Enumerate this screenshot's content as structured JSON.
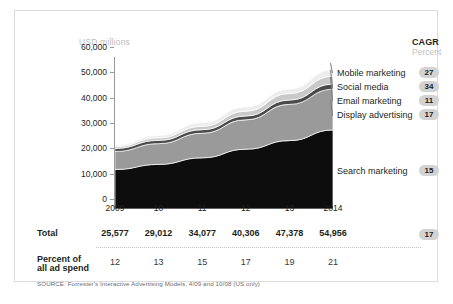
{
  "chart_data": {
    "type": "area",
    "title": "",
    "ylabel": "USD millions",
    "xlabel": "",
    "categories": [
      "2009",
      "10",
      "11",
      "12",
      "13",
      "2014"
    ],
    "x": [
      2009,
      2010,
      2011,
      2012,
      2013,
      2014
    ],
    "ylim": [
      0,
      60000
    ],
    "yticks": [
      "0",
      "10,000",
      "20,000",
      "30,000",
      "40,000",
      "50,000",
      "60,000"
    ],
    "ytick_values": [
      0,
      10000,
      20000,
      30000,
      40000,
      50000,
      60000
    ],
    "grid": false,
    "stacked": true,
    "legend_position": "right",
    "series": [
      {
        "name": "Search marketing",
        "color": "#0d0d0d",
        "cagr": "15",
        "values": [
          15600,
          17600,
          20200,
          23600,
          27000,
          31200
        ]
      },
      {
        "name": "Display advertising",
        "color": "#9a9a9a",
        "cagr": "17",
        "values": [
          7100,
          8200,
          9700,
          11600,
          14300,
          16100
        ]
      },
      {
        "name": "Email marketing",
        "color": "#4a4a4a",
        "cagr": "11",
        "values": [
          1200,
          1300,
          1400,
          1500,
          1700,
          2000
        ]
      },
      {
        "name": "Social media",
        "color": "#c9c9c9",
        "cagr": "34",
        "values": [
          716,
          980,
          1350,
          1900,
          2600,
          3100
        ]
      },
      {
        "name": "Mobile marketing",
        "color": "#ededed",
        "cagr": "27",
        "values": [
          561,
          932,
          1427,
          1706,
          1778,
          2556
        ]
      }
    ],
    "totals": [
      "25,577",
      "29,012",
      "34,077",
      "40,306",
      "47,378",
      "54,956"
    ],
    "total_values": [
      25577,
      29012,
      34077,
      40306,
      47378,
      54956
    ],
    "percent_of_ad_spend": [
      "12",
      "13",
      "15",
      "17",
      "19",
      "21"
    ],
    "total_cagr": "17"
  },
  "header": {
    "cagr_title": "CAGR",
    "cagr_subtitle": "Percent"
  },
  "table": {
    "total_label": "Total",
    "percent_label_line1": "Percent of",
    "percent_label_line2": "all ad spend"
  },
  "source": "SOURCE: Forrester's Interactive Advertising Models, 4/09 and 10/08 (US only)"
}
